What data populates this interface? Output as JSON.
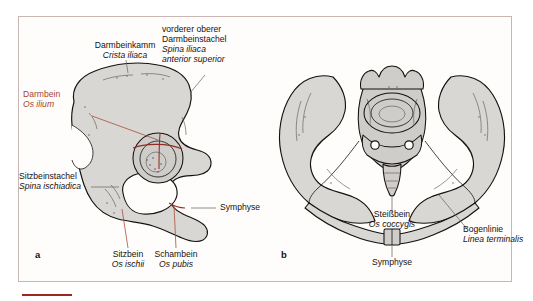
{
  "figure": {
    "panel_a": {
      "letter": "a",
      "labels": [
        {
          "id": "crista-iliaca",
          "de": "Darmbeinkamm",
          "la": "Crista iliaca",
          "color": "black"
        },
        {
          "id": "spina-iliaca-anterior-superior",
          "de": "vorderer oberer",
          "de2": "Darmbeinstachel",
          "la": "Spina iliaca",
          "la2": "anterior superior",
          "color": "black"
        },
        {
          "id": "os-ilium",
          "de": "Darmbein",
          "la": "Os ilium",
          "color": "red"
        },
        {
          "id": "spina-ischiadica",
          "de": "Sitzbeinstachel",
          "la": "Spina ischiadica",
          "color": "black"
        },
        {
          "id": "symphyse-a",
          "de": "Symphyse",
          "la": "",
          "color": "black"
        },
        {
          "id": "os-ischii",
          "de": "Sitzbein",
          "la": "Os ischii",
          "color": "red"
        },
        {
          "id": "os-pubis",
          "de": "Schambein",
          "la": "Os pubis",
          "color": "red"
        }
      ]
    },
    "panel_b": {
      "letter": "b",
      "labels": [
        {
          "id": "os-coccygis",
          "de": "Steißbein",
          "la": "Os coccygis",
          "color": "black"
        },
        {
          "id": "symphyse-b",
          "de": "Symphyse",
          "la": "",
          "color": "black"
        },
        {
          "id": "linea-terminalis",
          "de": "Bogenlinie",
          "la": "Linea terminalis",
          "color": "black"
        }
      ]
    }
  },
  "colors": {
    "label_black": "#16120f",
    "label_red": "#a4472f",
    "bone_fill": "#d9d7d4",
    "bone_outline": "#14110f",
    "division_line": "#8f2d22",
    "frame_border": "#c9b6b2",
    "caption_rule": "#9c2a1c",
    "background": "#ffffff"
  }
}
